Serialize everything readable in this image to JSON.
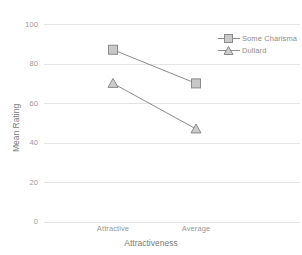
{
  "chart_data": {
    "type": "line",
    "title": "",
    "xlabel": "Attractiveness",
    "ylabel": "Mean Rating",
    "categories": [
      "Attractive",
      "Average"
    ],
    "ylim": [
      0,
      100
    ],
    "yticks": [
      0,
      20,
      40,
      60,
      80,
      100
    ],
    "ytick_labels": [
      "0",
      "20",
      "40",
      "60",
      "80",
      "100"
    ],
    "grid": true,
    "grid_axis": "y",
    "legend_position": "top-right",
    "series": [
      {
        "name": "Some Charisma",
        "marker": "square",
        "values": [
          87,
          70
        ],
        "color": "#8c8c8c"
      },
      {
        "name": "Dullard",
        "marker": "triangle",
        "values": [
          70,
          47
        ],
        "color": "#8c8c8c"
      }
    ]
  },
  "axes": {
    "y_title": "Mean Rating",
    "x_title": "Attractiveness",
    "y_ticks": [
      "100",
      "80",
      "60",
      "40",
      "20",
      "0"
    ],
    "x_ticks": [
      "Attractive",
      "Average"
    ]
  },
  "legend": {
    "items": [
      {
        "label": "Some Charisma",
        "marker": "square-marker-icon"
      },
      {
        "label": "Dullard",
        "marker": "triangle-marker-icon"
      }
    ]
  },
  "colors": {
    "background": "#ffffff",
    "grid": "#e2e2e2",
    "series_line": "#8c8c8c",
    "marker_fill": "#c8c8c8",
    "marker_stroke": "#8a8a8a",
    "text": "#8d8d8d"
  }
}
